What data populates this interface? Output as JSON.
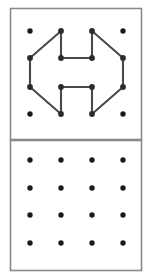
{
  "figure": {
    "canvas": {
      "width": 152,
      "height": 279
    },
    "colors": {
      "background": "#ffffff",
      "frame_stroke": "#8a8a8a",
      "dot_fill": "#1b1b1b",
      "path_stroke": "#4a4a4a",
      "node_fill": "#2b2b2b"
    },
    "geometry": {
      "dot_radius": 2.7,
      "node_radius": 2.9,
      "path_stroke_width": 2.1,
      "frame_stroke_width": 1.6
    }
  },
  "panels": [
    {
      "name": "top-panel",
      "label": "Figure with path",
      "frame": {
        "x": 10.5,
        "y": 8.5,
        "width": 131,
        "height": 131
      },
      "grid": {
        "columns": 4,
        "rows": 4,
        "column_x": [
          30,
          61,
          92,
          123
        ],
        "row_y": [
          31,
          58,
          87,
          114
        ]
      },
      "dots": [
        {
          "col": 0,
          "row": 0,
          "x": 30,
          "y": 31
        },
        {
          "col": 1,
          "row": 0,
          "x": 61,
          "y": 31
        },
        {
          "col": 2,
          "row": 0,
          "x": 92,
          "y": 31
        },
        {
          "col": 3,
          "row": 0,
          "x": 123,
          "y": 31
        },
        {
          "col": 0,
          "row": 1,
          "x": 30,
          "y": 58
        },
        {
          "col": 1,
          "row": 1,
          "x": 61,
          "y": 58
        },
        {
          "col": 2,
          "row": 1,
          "x": 92,
          "y": 58
        },
        {
          "col": 3,
          "row": 1,
          "x": 123,
          "y": 58
        },
        {
          "col": 0,
          "row": 2,
          "x": 30,
          "y": 87
        },
        {
          "col": 1,
          "row": 2,
          "x": 61,
          "y": 87
        },
        {
          "col": 2,
          "row": 2,
          "x": 92,
          "y": 87
        },
        {
          "col": 3,
          "row": 2,
          "x": 123,
          "y": 87
        },
        {
          "col": 0,
          "row": 3,
          "x": 30,
          "y": 114
        },
        {
          "col": 1,
          "row": 3,
          "x": 61,
          "y": 114
        },
        {
          "col": 2,
          "row": 3,
          "x": 92,
          "y": 114
        },
        {
          "col": 3,
          "row": 3,
          "x": 123,
          "y": 114
        }
      ],
      "path_segments": [
        {
          "name": "left-upper-diagonal",
          "x1": 30,
          "y1": 58,
          "x2": 61,
          "y2": 31
        },
        {
          "name": "left-vertical",
          "x1": 30,
          "y1": 58,
          "x2": 30,
          "y2": 87
        },
        {
          "name": "left-lower-diagonal",
          "x1": 30,
          "y1": 87,
          "x2": 61,
          "y2": 114
        },
        {
          "name": "right-upper-diagonal",
          "x1": 92,
          "y1": 31,
          "x2": 123,
          "y2": 58
        },
        {
          "name": "right-vertical",
          "x1": 123,
          "y1": 58,
          "x2": 123,
          "y2": 87
        },
        {
          "name": "right-lower-diagonal",
          "x1": 123,
          "y1": 87,
          "x2": 92,
          "y2": 114
        },
        {
          "name": "inner-upper-left-stem",
          "x1": 61,
          "y1": 31,
          "x2": 61,
          "y2": 58
        },
        {
          "name": "inner-upper-crossbar",
          "x1": 61,
          "y1": 58,
          "x2": 92,
          "y2": 58
        },
        {
          "name": "inner-upper-right-stem",
          "x1": 92,
          "y1": 58,
          "x2": 92,
          "y2": 31
        },
        {
          "name": "inner-lower-left-stem",
          "x1": 61,
          "y1": 87,
          "x2": 61,
          "y2": 114
        },
        {
          "name": "inner-lower-crossbar",
          "x1": 61,
          "y1": 87,
          "x2": 92,
          "y2": 87
        },
        {
          "name": "inner-lower-right-stem",
          "x1": 92,
          "y1": 87,
          "x2": 92,
          "y2": 114
        }
      ],
      "path_nodes": [
        {
          "x": 61,
          "y": 31
        },
        {
          "x": 92,
          "y": 31
        },
        {
          "x": 30,
          "y": 58
        },
        {
          "x": 61,
          "y": 58
        },
        {
          "x": 92,
          "y": 58
        },
        {
          "x": 123,
          "y": 58
        },
        {
          "x": 30,
          "y": 87
        },
        {
          "x": 61,
          "y": 87
        },
        {
          "x": 92,
          "y": 87
        },
        {
          "x": 123,
          "y": 87
        },
        {
          "x": 61,
          "y": 114
        },
        {
          "x": 92,
          "y": 114
        }
      ],
      "plain_dots": [
        {
          "x": 30,
          "y": 31
        },
        {
          "x": 123,
          "y": 31
        },
        {
          "x": 30,
          "y": 114
        },
        {
          "x": 123,
          "y": 114
        }
      ]
    },
    {
      "name": "bottom-panel",
      "label": "Empty answer grid",
      "frame": {
        "x": 10.5,
        "y": 140.5,
        "width": 131,
        "height": 130
      },
      "grid": {
        "columns": 4,
        "rows": 4,
        "column_x": [
          30,
          61,
          92,
          123
        ],
        "row_y": [
          160,
          188,
          215,
          243
        ]
      },
      "dots": [
        {
          "col": 0,
          "row": 0,
          "x": 30,
          "y": 160
        },
        {
          "col": 1,
          "row": 0,
          "x": 61,
          "y": 160
        },
        {
          "col": 2,
          "row": 0,
          "x": 92,
          "y": 160
        },
        {
          "col": 3,
          "row": 0,
          "x": 123,
          "y": 160
        },
        {
          "col": 0,
          "row": 1,
          "x": 30,
          "y": 188
        },
        {
          "col": 1,
          "row": 1,
          "x": 61,
          "y": 188
        },
        {
          "col": 2,
          "row": 1,
          "x": 92,
          "y": 188
        },
        {
          "col": 3,
          "row": 1,
          "x": 123,
          "y": 188
        },
        {
          "col": 0,
          "row": 2,
          "x": 30,
          "y": 215
        },
        {
          "col": 1,
          "row": 2,
          "x": 61,
          "y": 215
        },
        {
          "col": 2,
          "row": 2,
          "x": 92,
          "y": 215
        },
        {
          "col": 3,
          "row": 2,
          "x": 123,
          "y": 215
        },
        {
          "col": 0,
          "row": 3,
          "x": 30,
          "y": 243
        },
        {
          "col": 1,
          "row": 3,
          "x": 61,
          "y": 243
        },
        {
          "col": 2,
          "row": 3,
          "x": 92,
          "y": 243
        },
        {
          "col": 3,
          "row": 3,
          "x": 123,
          "y": 243
        }
      ],
      "path_segments": [],
      "path_nodes": []
    }
  ]
}
